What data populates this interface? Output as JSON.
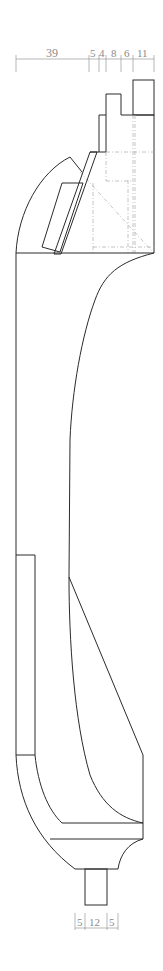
{
  "drawing": {
    "type": "technical-drawing",
    "subject": "turned part profile (section view)",
    "colors": {
      "outline": "#2b2b2b",
      "hidden": "#b5b5b5",
      "dimension": "#8a8a8a",
      "background": "#ffffff"
    },
    "top_dimensions": {
      "y": 59,
      "segments": [
        {
          "label": "39",
          "x1": 16,
          "x2": 89
        },
        {
          "label": "5",
          "x1": 89,
          "x2": 99
        },
        {
          "label": "4",
          "x1": 99,
          "x2": 106
        },
        {
          "label": "8",
          "x1": 106,
          "x2": 121
        },
        {
          "label": "6",
          "x1": 121,
          "x2": 133
        },
        {
          "label": "11",
          "x1": 133,
          "x2": 154
        }
      ]
    },
    "bottom_dimensions": {
      "y": 928,
      "segments": [
        {
          "label": "5",
          "x1": 75,
          "x2": 85
        },
        {
          "label": "12",
          "x1": 85,
          "x2": 107
        },
        {
          "label": "5",
          "x1": 107,
          "x2": 118
        }
      ]
    }
  }
}
